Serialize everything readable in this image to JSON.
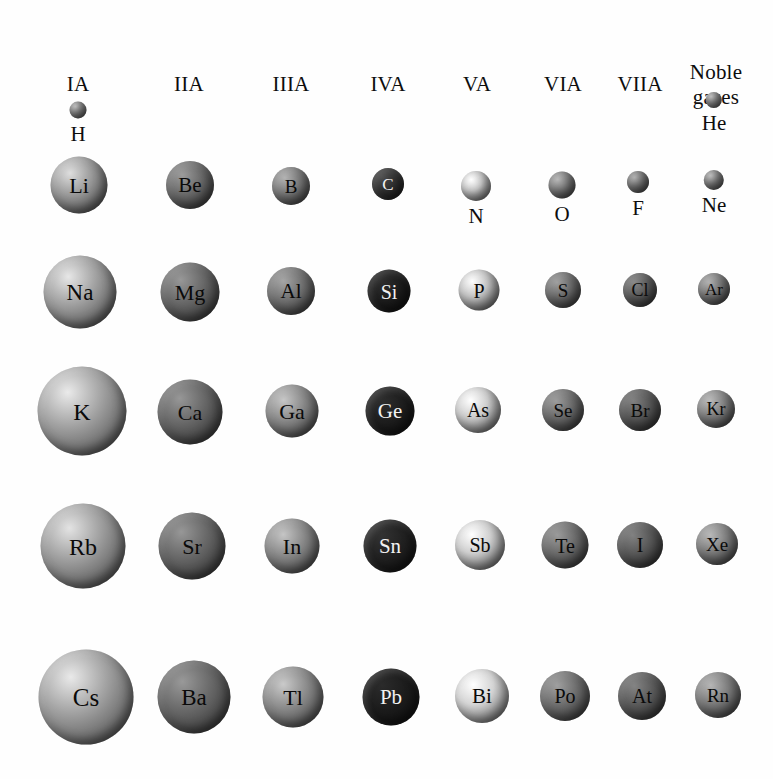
{
  "figure": {
    "background_color": "#ffffff",
    "width": 773,
    "height": 779
  },
  "headers": [
    {
      "label": "IA",
      "cx": 78,
      "cy": 72,
      "lines": 1
    },
    {
      "label": "IIA",
      "cx": 189,
      "cy": 72,
      "lines": 1
    },
    {
      "label": "IIIA",
      "cx": 291,
      "cy": 72,
      "lines": 1
    },
    {
      "label": "IVA",
      "cx": 388,
      "cy": 72,
      "lines": 1
    },
    {
      "label": "VA",
      "cx": 477,
      "cy": 72,
      "lines": 1
    },
    {
      "label": "VIA",
      "cx": 563,
      "cy": 72,
      "lines": 1
    },
    {
      "label": "VIIA",
      "cx": 640,
      "cy": 72,
      "lines": 1
    },
    {
      "label": "Noble\ngases",
      "cx": 716,
      "cy": 60,
      "lines": 2
    }
  ],
  "chart_data": {
    "type": "scatter",
    "xlabel": "Group",
    "ylabel": "Period",
    "grid": false,
    "legend": null,
    "encoding": "marker area proportional to atomic radius; marker shade indicates group column",
    "categories": [
      "IA",
      "IIA",
      "IIIA",
      "IVA",
      "VA",
      "VIA",
      "VIIA",
      "Noble gases"
    ],
    "rows": [
      "Period 1",
      "Period 2",
      "Period 3",
      "Period 4",
      "Period 5",
      "Period 6"
    ],
    "column_centers_px": [
      78,
      190,
      291,
      389,
      478,
      563,
      640,
      715
    ],
    "row_centers_px": [
      113,
      185,
      292,
      412,
      546,
      697
    ],
    "elements": [
      {
        "symbol": "H",
        "group": "IA",
        "period": 1,
        "cx": 78,
        "cy": 113,
        "d": 17,
        "color": "#8c8c8c",
        "label_pos": "below",
        "font": 21
      },
      {
        "symbol": "He",
        "group": "Noble gases",
        "period": 1,
        "cx": 714,
        "cy": 104,
        "d": 16,
        "color": "#8f8f8f",
        "label_pos": "below",
        "font": 21
      },
      {
        "symbol": "Li",
        "group": "IA",
        "period": 2,
        "cx": 79,
        "cy": 185,
        "d": 57,
        "color": "#9c9c9c",
        "label_pos": "inside",
        "font": 22
      },
      {
        "symbol": "Be",
        "group": "IIA",
        "period": 2,
        "cx": 190,
        "cy": 185,
        "d": 48,
        "color": "#6e6e6e",
        "label_pos": "inside",
        "font": 21
      },
      {
        "symbol": "B",
        "group": "IIIA",
        "period": 2,
        "cx": 291,
        "cy": 186,
        "d": 38,
        "color": "#7d7d7d",
        "label_pos": "inside",
        "font": 19
      },
      {
        "symbol": "C",
        "group": "IVA",
        "period": 2,
        "cx": 388,
        "cy": 184,
        "d": 32,
        "color": "#333333",
        "label_pos": "inside",
        "font": 17
      },
      {
        "symbol": "N",
        "group": "VA",
        "period": 2,
        "cx": 476,
        "cy": 183,
        "d": 30,
        "color": "#c9c9c9",
        "label_pos": "below",
        "font": 21
      },
      {
        "symbol": "O",
        "group": "VIA",
        "period": 2,
        "cx": 562,
        "cy": 183,
        "d": 27,
        "color": "#7f7f7f",
        "label_pos": "below",
        "font": 21
      },
      {
        "symbol": "F",
        "group": "VIIA",
        "period": 2,
        "cx": 638,
        "cy": 183,
        "d": 22,
        "color": "#7a7a7a",
        "label_pos": "below",
        "font": 21
      },
      {
        "symbol": "Ne",
        "group": "Noble gases",
        "period": 2,
        "cx": 714,
        "cy": 182,
        "d": 20,
        "color": "#858585",
        "label_pos": "below",
        "font": 21
      },
      {
        "symbol": "Na",
        "group": "IA",
        "period": 3,
        "cx": 80,
        "cy": 292,
        "d": 73,
        "color": "#a3a3a3",
        "label_pos": "inside",
        "font": 23
      },
      {
        "symbol": "Mg",
        "group": "IIA",
        "period": 3,
        "cx": 190,
        "cy": 292,
        "d": 59,
        "color": "#6b6b6b",
        "label_pos": "inside",
        "font": 22
      },
      {
        "symbol": "Al",
        "group": "IIIA",
        "period": 3,
        "cx": 291,
        "cy": 291,
        "d": 48,
        "color": "#757575",
        "label_pos": "inside",
        "font": 21
      },
      {
        "symbol": "Si",
        "group": "IVA",
        "period": 3,
        "cx": 389,
        "cy": 291,
        "d": 43,
        "color": "#1f1f1f",
        "label_pos": "inside",
        "font": 20
      },
      {
        "symbol": "P",
        "group": "VA",
        "period": 3,
        "cx": 479,
        "cy": 290,
        "d": 41,
        "color": "#c4c4c4",
        "label_pos": "inside",
        "font": 20
      },
      {
        "symbol": "S",
        "group": "VIA",
        "period": 3,
        "cx": 563,
        "cy": 290,
        "d": 36,
        "color": "#6f6f6f",
        "label_pos": "inside",
        "font": 19
      },
      {
        "symbol": "Cl",
        "group": "VIIA",
        "period": 3,
        "cx": 640,
        "cy": 290,
        "d": 34,
        "color": "#5e5e5e",
        "label_pos": "inside",
        "font": 18
      },
      {
        "symbol": "Ar",
        "group": "Noble gases",
        "period": 3,
        "cx": 714,
        "cy": 289,
        "d": 32,
        "color": "#7b7b7b",
        "label_pos": "inside",
        "font": 17
      },
      {
        "symbol": "K",
        "group": "IA",
        "period": 4,
        "cx": 82,
        "cy": 411,
        "d": 89,
        "color": "#a5a5a5",
        "label_pos": "inside",
        "font": 24
      },
      {
        "symbol": "Ca",
        "group": "IIA",
        "period": 4,
        "cx": 190,
        "cy": 412,
        "d": 65,
        "color": "#6a6a6a",
        "label_pos": "inside",
        "font": 22
      },
      {
        "symbol": "Ga",
        "group": "IIIA",
        "period": 4,
        "cx": 292,
        "cy": 411,
        "d": 53,
        "color": "#8c8c8c",
        "label_pos": "inside",
        "font": 22
      },
      {
        "symbol": "Ge",
        "group": "IVA",
        "period": 4,
        "cx": 390,
        "cy": 411,
        "d": 49,
        "color": "#202020",
        "label_pos": "inside",
        "font": 21
      },
      {
        "symbol": "As",
        "group": "VA",
        "period": 4,
        "cx": 478,
        "cy": 410,
        "d": 46,
        "color": "#cdcdcd",
        "label_pos": "inside",
        "font": 20
      },
      {
        "symbol": "Se",
        "group": "VIA",
        "period": 4,
        "cx": 563,
        "cy": 410,
        "d": 42,
        "color": "#6e6e6e",
        "label_pos": "inside",
        "font": 19
      },
      {
        "symbol": "Br",
        "group": "VIIA",
        "period": 4,
        "cx": 640,
        "cy": 410,
        "d": 42,
        "color": "#5a5a5a",
        "label_pos": "inside",
        "font": 19
      },
      {
        "symbol": "Kr",
        "group": "Noble gases",
        "period": 4,
        "cx": 716,
        "cy": 409,
        "d": 38,
        "color": "#848484",
        "label_pos": "inside",
        "font": 18
      },
      {
        "symbol": "Rb",
        "group": "IA",
        "period": 5,
        "cx": 83,
        "cy": 546,
        "d": 85,
        "color": "#a0a0a0",
        "label_pos": "inside",
        "font": 24
      },
      {
        "symbol": "Sr",
        "group": "IIA",
        "period": 5,
        "cx": 192,
        "cy": 546,
        "d": 67,
        "color": "#6a6a6a",
        "label_pos": "inside",
        "font": 22
      },
      {
        "symbol": "In",
        "group": "IIIA",
        "period": 5,
        "cx": 292,
        "cy": 546,
        "d": 55,
        "color": "#8b8b8b",
        "label_pos": "inside",
        "font": 22
      },
      {
        "symbol": "Sn",
        "group": "IVA",
        "period": 5,
        "cx": 390,
        "cy": 546,
        "d": 53,
        "color": "#232323",
        "label_pos": "inside",
        "font": 21
      },
      {
        "symbol": "Sb",
        "group": "VA",
        "period": 5,
        "cx": 480,
        "cy": 545,
        "d": 50,
        "color": "#cfcfcf",
        "label_pos": "inside",
        "font": 20
      },
      {
        "symbol": "Te",
        "group": "VIA",
        "period": 5,
        "cx": 565,
        "cy": 545,
        "d": 47,
        "color": "#6d6d6d",
        "label_pos": "inside",
        "font": 20
      },
      {
        "symbol": "I",
        "group": "VIIA",
        "period": 5,
        "cx": 640,
        "cy": 545,
        "d": 46,
        "color": "#5b5b5b",
        "label_pos": "inside",
        "font": 20
      },
      {
        "symbol": "Xe",
        "group": "Noble gases",
        "period": 5,
        "cx": 717,
        "cy": 544,
        "d": 42,
        "color": "#828282",
        "label_pos": "inside",
        "font": 19
      },
      {
        "symbol": "Cs",
        "group": "IA",
        "period": 6,
        "cx": 86,
        "cy": 697,
        "d": 95,
        "color": "#a4a4a4",
        "label_pos": "inside",
        "font": 25
      },
      {
        "symbol": "Ba",
        "group": "IIA",
        "period": 6,
        "cx": 194,
        "cy": 697,
        "d": 73,
        "color": "#6c6c6c",
        "label_pos": "inside",
        "font": 23
      },
      {
        "symbol": "Tl",
        "group": "IIIA",
        "period": 6,
        "cx": 293,
        "cy": 697,
        "d": 61,
        "color": "#8e8e8e",
        "label_pos": "inside",
        "font": 22
      },
      {
        "symbol": "Pb",
        "group": "IVA",
        "period": 6,
        "cx": 391,
        "cy": 697,
        "d": 57,
        "color": "#1e1e1e",
        "label_pos": "inside",
        "font": 21
      },
      {
        "symbol": "Bi",
        "group": "VA",
        "period": 6,
        "cx": 482,
        "cy": 696,
        "d": 54,
        "color": "#d4d4d4",
        "label_pos": "inside",
        "font": 21
      },
      {
        "symbol": "Po",
        "group": "VIA",
        "period": 6,
        "cx": 565,
        "cy": 696,
        "d": 50,
        "color": "#717171",
        "label_pos": "inside",
        "font": 20
      },
      {
        "symbol": "At",
        "group": "VIIA",
        "period": 6,
        "cx": 642,
        "cy": 696,
        "d": 48,
        "color": "#5d5d5d",
        "label_pos": "inside",
        "font": 20
      },
      {
        "symbol": "Rn",
        "group": "Noble gases",
        "period": 6,
        "cx": 718,
        "cy": 695,
        "d": 46,
        "color": "#808080",
        "label_pos": "inside",
        "font": 19
      }
    ]
  }
}
